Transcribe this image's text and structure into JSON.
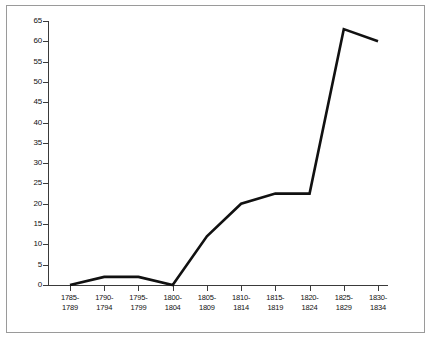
{
  "chart_data": {
    "type": "line",
    "title": "",
    "subtitle": "",
    "xlabel": "",
    "ylabel": "",
    "categories": [
      "1785-1789",
      "1790-1794",
      "1795-1799",
      "1800-1804",
      "1805-1809",
      "1810-1814",
      "1815-1819",
      "1820-1824",
      "1825-1829",
      "1830-1834"
    ],
    "category_lines": [
      [
        "1785-",
        "1789"
      ],
      [
        "1790-",
        "1794"
      ],
      [
        "1795-",
        "1799"
      ],
      [
        "1800-",
        "1804"
      ],
      [
        "1805-",
        "1809"
      ],
      [
        "1810-",
        "1814"
      ],
      [
        "1815-",
        "1819"
      ],
      [
        "1820-",
        "1824"
      ],
      [
        "1825-",
        "1829"
      ],
      [
        "1830-",
        "1834"
      ]
    ],
    "values": [
      0,
      2,
      2,
      0,
      12,
      20,
      22.5,
      22.5,
      63,
      60
    ],
    "ylim": [
      0,
      65
    ],
    "ytick_values": [
      0,
      5,
      10,
      15,
      20,
      25,
      30,
      35,
      40,
      45,
      50,
      55,
      60,
      65
    ],
    "ytick_labels": [
      "0",
      "5",
      "10",
      "15",
      "20",
      "25",
      "30",
      "35",
      "40",
      "45",
      "50",
      "55",
      "60",
      "65"
    ],
    "grid": false,
    "legend": null,
    "legend_position": "none",
    "series_color": "#111111",
    "axis_color": "#3a3a3a",
    "background_color": "#ffffff",
    "border_color": "#9a9a9a"
  }
}
